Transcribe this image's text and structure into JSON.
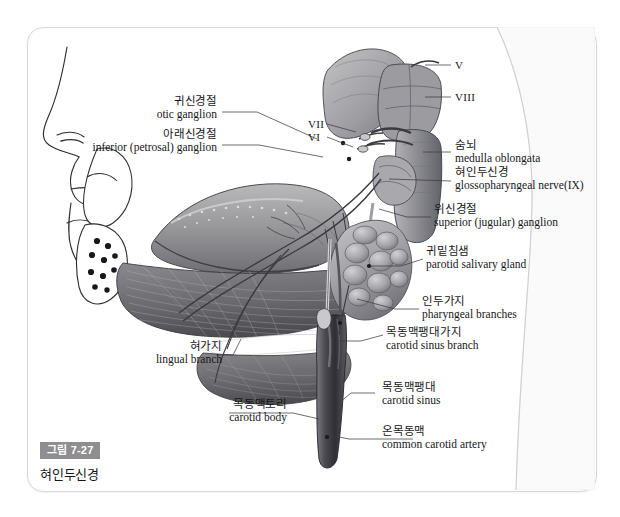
{
  "figure": {
    "top_clipped_text": "",
    "caption_badge": "그림 7-27",
    "caption_title": "혀인두신경"
  },
  "roman_numerals": [
    {
      "id": "vii-left",
      "text": "VII"
    },
    {
      "id": "vi-left",
      "text": "VI"
    },
    {
      "id": "v-right",
      "text": "V"
    },
    {
      "id": "viii-right",
      "text": "VIII"
    }
  ],
  "labels": [
    {
      "id": "otic-ganglion",
      "ko": "귀신경절",
      "en": "otic ganglion"
    },
    {
      "id": "inferior-ganglion",
      "ko": "아래신경절",
      "en": "inferior (petrosal) ganglion"
    },
    {
      "id": "medulla-oblongata",
      "ko": "숨뇌",
      "en": "medulla oblongata"
    },
    {
      "id": "glossopharyngeal",
      "ko": "혀인두신경",
      "en": "glossopharyngeal nerve(IX)"
    },
    {
      "id": "superior-ganglion",
      "ko": "위신경절",
      "en": "superior (jugular) ganglion"
    },
    {
      "id": "parotid-gland",
      "ko": "귀밑침샘",
      "en": "parotid salivary gland"
    },
    {
      "id": "pharyngeal-branches",
      "ko": "인두가지",
      "en": "pharyngeal branches"
    },
    {
      "id": "carotid-sinus-branch",
      "ko": "목동맥팽대가지",
      "en": "carotid sinus branch"
    },
    {
      "id": "lingual-branch",
      "ko": "혀가지",
      "en": "lingual branch"
    },
    {
      "id": "carotid-body",
      "ko": "목동맥토리",
      "en": "carotid body"
    },
    {
      "id": "carotid-sinus",
      "ko": "목동맥팽대",
      "en": "carotid sinus"
    },
    {
      "id": "common-carotid",
      "ko": "온목동맥",
      "en": "common carotid artery"
    }
  ],
  "colors": {
    "frame_border": "#d7d7d9",
    "badge_background": "#8e8e90",
    "badge_text": "#ffffff",
    "label_text": "#17171a",
    "leader_line": "#3c3c40",
    "page_background": "#ffffff"
  }
}
